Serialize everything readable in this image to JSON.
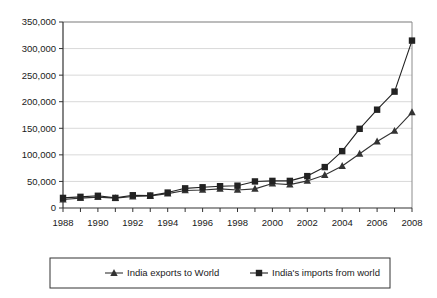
{
  "chart_data": {
    "type": "line",
    "title": "",
    "xlabel": "",
    "ylabel": "",
    "x": [
      1988,
      1989,
      1990,
      1991,
      1992,
      1993,
      1994,
      1995,
      1996,
      1997,
      1998,
      1999,
      2000,
      2001,
      2002,
      2003,
      2004,
      2005,
      2006,
      2007,
      2008
    ],
    "xlim": [
      1988,
      2008
    ],
    "ylim": [
      0,
      350000
    ],
    "ytick_values": [
      0,
      50000,
      100000,
      150000,
      200000,
      250000,
      300000,
      350000
    ],
    "ytick_labels": [
      "0",
      "50,000",
      "100,000",
      "150,000",
      "200,000",
      "250,000",
      "300,000",
      "350,000"
    ],
    "xtick_labels": [
      "1988",
      "1990",
      "1992",
      "1994",
      "1996",
      "1998",
      "2000",
      "2002",
      "2004",
      "2006",
      "2008"
    ],
    "xtick_labeled_values": [
      1988,
      1990,
      1992,
      1994,
      1996,
      1998,
      2000,
      2002,
      2004,
      2006,
      2008
    ],
    "grid": "horizontal",
    "legend_position": "bottom",
    "series": [
      {
        "name": "India exports to World",
        "marker": "triangle",
        "color": "#333333",
        "values": [
          16000,
          18500,
          20500,
          18500,
          21500,
          22500,
          27000,
          33000,
          34000,
          36000,
          34000,
          36000,
          46000,
          44000,
          51000,
          62000,
          79000,
          102000,
          125000,
          145000,
          180000
        ]
      },
      {
        "name": "India's imports from world",
        "marker": "square",
        "color": "#222222",
        "values": [
          19000,
          21000,
          23000,
          19000,
          24000,
          23500,
          29000,
          37000,
          39000,
          41000,
          42000,
          50000,
          51000,
          51000,
          60000,
          77000,
          107000,
          149000,
          185000,
          219000,
          315000
        ]
      }
    ]
  },
  "legend": {
    "items": [
      {
        "label": "India exports to World",
        "marker": "triangle-marker"
      },
      {
        "label": "India's imports from world",
        "marker": "square-marker"
      }
    ]
  }
}
